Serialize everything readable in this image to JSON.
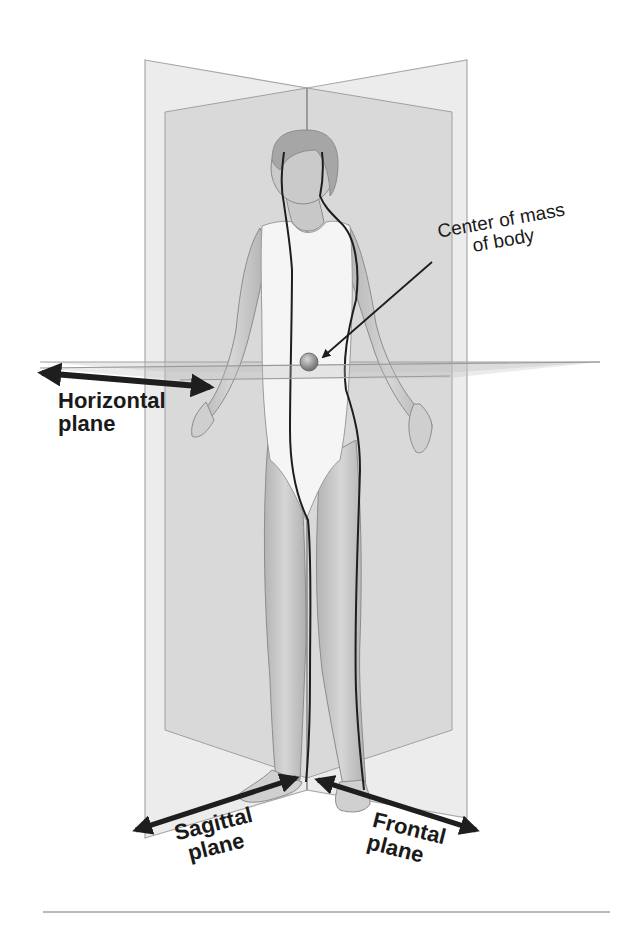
{
  "figure": {
    "type": "anatomical-planes-diagram",
    "colors": {
      "background": "#ffffff",
      "plane_outer": "#e6e6e6",
      "plane_inner": "#d2d2d2",
      "plane_edge": "#a8a8a8",
      "body_fill": "#c8c8c8",
      "garment_fill": "#f4f4f4",
      "outline_dark": "#1e1e1e",
      "center_of_mass": "#8a8a8a",
      "rule": "#777777"
    }
  },
  "labels": {
    "center_of_mass": {
      "line1": "Center of mass",
      "line2": "of body"
    },
    "horizontal_plane": {
      "line1": "Horizontal",
      "line2": "plane"
    },
    "sagittal_plane": {
      "line1": "Sagittal",
      "line2": "plane"
    },
    "frontal_plane": {
      "line1": "Frontal",
      "line2": "plane"
    }
  }
}
